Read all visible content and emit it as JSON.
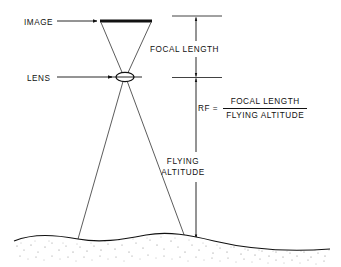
{
  "diagram": {
    "labels": {
      "image": "IMAGE",
      "lens": "LENS",
      "focal_length": "FOCAL LENGTH",
      "flying_altitude_line1": "FLYING",
      "flying_altitude_line2": "ALTITUDE"
    },
    "formula": {
      "lhs": "RF  =",
      "numerator": "FOCAL LENGTH",
      "denominator": "FLYING ALTITUDE"
    },
    "colors": {
      "ink": "#111111",
      "line": "#333333",
      "ground_stipple": "#8a8a8a",
      "background": "#ffffff"
    },
    "geometry": {
      "image_plane": {
        "x1": 100,
        "x2": 152,
        "y": 21
      },
      "lens": {
        "cx": 125,
        "cy": 77,
        "rx": 9,
        "ry": 4.5
      },
      "ground_contact": {
        "left_x": 78,
        "right_x": 186,
        "y": 239
      },
      "dimension_line_x": 196,
      "dimension_top_y": 16,
      "dimension_mid_y": 77,
      "dimension_bottom_y": 239
    }
  }
}
